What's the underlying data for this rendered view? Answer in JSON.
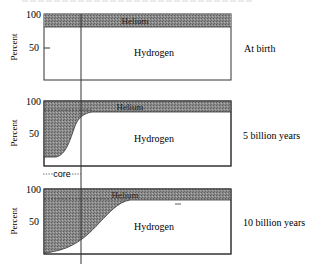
{
  "diagram": {
    "y_axis_label": "Percent",
    "y_ticks": [
      "100",
      "50"
    ],
    "core_label": "core",
    "colors": {
      "helium_fill": "#7a7a7a",
      "axis": "#333333",
      "background": "#ffffff"
    },
    "panels": [
      {
        "stage": "At birth",
        "helium_label": "Helium",
        "hydrogen_label": "Hydrogen"
      },
      {
        "stage": "5 billion years",
        "helium_label": "Helium",
        "hydrogen_label": "Hydrogen"
      },
      {
        "stage": "10 billion years",
        "helium_label": "Helium",
        "hydrogen_label": "Hydrogen"
      }
    ]
  }
}
